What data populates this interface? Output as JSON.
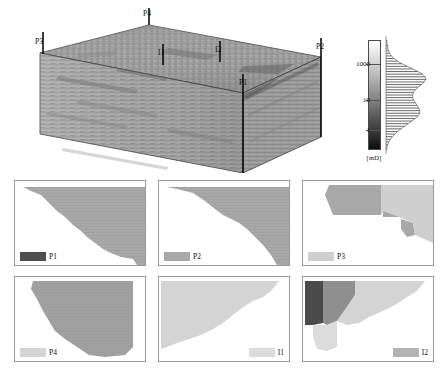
{
  "figure": {
    "header_remnant": "",
    "type": "reservoir-permeability-model"
  },
  "block": {
    "title": "3D reservoir permeability block",
    "wells": [
      {
        "name": "P4",
        "label": "P4",
        "x": 128,
        "y": 10,
        "stem_x": 131,
        "stem_top": 17,
        "stem_bottom": 45,
        "kind": "producer"
      },
      {
        "name": "P3",
        "label": "P3",
        "x": 22,
        "y": 36,
        "stem_x": 25,
        "stem_top": 43,
        "stem_bottom": 67,
        "kind": "producer"
      },
      {
        "name": "I1",
        "label": "I1",
        "x": 142,
        "y": 48,
        "stem_x": 145,
        "stem_top": 55,
        "stem_bottom": 77,
        "kind": "injector"
      },
      {
        "name": "I2",
        "label": "I2",
        "x": 199,
        "y": 45,
        "stem_x": 202,
        "stem_top": 52,
        "stem_bottom": 74,
        "kind": "injector"
      },
      {
        "name": "P2",
        "label": "P2",
        "x": 300,
        "y": 42,
        "stem_x": 303,
        "stem_top": 49,
        "stem_bottom": 140,
        "kind": "producer"
      },
      {
        "name": "P1",
        "label": "P1",
        "x": 222,
        "y": 78,
        "stem_x": 225,
        "stem_top": 85,
        "stem_bottom": 165,
        "kind": "producer"
      }
    ]
  },
  "colorbar": {
    "name": "permeability-colorbar",
    "unit": "[mD]",
    "scale": "log",
    "ticks": [
      {
        "label": "1000",
        "value": 1000,
        "pos_pct": 22
      },
      {
        "label": "10",
        "value": 10,
        "pos_pct": 55
      },
      {
        "label": "1",
        "value": 1,
        "pos_pct": 83
      }
    ],
    "min_color": "#ffffff",
    "max_color": "#0d0d0d",
    "histogram": {
      "name": "permeability-histogram",
      "orientation": "horizontal-bars",
      "bins": [
        1,
        1,
        2,
        2,
        3,
        4,
        6,
        9,
        13,
        18,
        24,
        30,
        36,
        41,
        44,
        45,
        43,
        40,
        36,
        33,
        31,
        30,
        30,
        31,
        33,
        35,
        37,
        38,
        38,
        36,
        33,
        29,
        25,
        21,
        17,
        13,
        10,
        7,
        5,
        3,
        2,
        1,
        1
      ]
    }
  },
  "chart_data": {
    "type": "heatmap",
    "xlabel": "",
    "ylabel": "",
    "colorbar_unit": "[mD]",
    "colorbar_ticks": [
      1,
      10,
      1000
    ],
    "colorbar_scale": "log",
    "grid": false,
    "legend_position": "in-panel",
    "series": [
      {
        "name": "P4",
        "values": [
          1000,
          500,
          100,
          10,
          1
        ]
      },
      {
        "name": "P3",
        "values": [
          1000,
          500,
          100,
          10,
          1
        ]
      },
      {
        "name": "P2",
        "values": [
          1000,
          500,
          100,
          10,
          1
        ]
      },
      {
        "name": "P1",
        "values": [
          1000,
          500,
          100,
          10,
          1
        ]
      },
      {
        "name": "I1",
        "values": [
          1000,
          500,
          100,
          10,
          1
        ]
      },
      {
        "name": "I2",
        "values": [
          1000,
          500,
          100,
          10,
          1
        ]
      }
    ],
    "panels": [
      {
        "id": "P1",
        "label": "P1",
        "row": 0,
        "col": 0,
        "swatch_color": "#4f4f4f",
        "legend_side": "left",
        "description": "Staircase drainage region descending from upper-left to lower-right; region fills upper-right of panel.",
        "regions": [
          {
            "color": "#a8a8a8",
            "poly": "8,6 130,6 130,84 122,84 118,78 106,76 96,72 88,68 80,62 72,56 66,50 58,44 50,36 42,30 34,22 26,14 16,10"
          }
        ],
        "stripes": true
      },
      {
        "id": "P2",
        "label": "P2",
        "row": 0,
        "col": 1,
        "swatch_color": "#a8a8a8",
        "legend_side": "left",
        "description": "Drainage region with a broad plateau mid-panel then a steep drop on the right.",
        "regions": [
          {
            "color": "#a8a8a8",
            "poly": "8,6 130,6 130,84 118,84 112,74 104,64 96,56 88,48 80,42 72,38 64,34 56,28 46,20 34,12 18,8"
          }
        ],
        "stripes": true
      },
      {
        "id": "P3",
        "label": "P3",
        "row": 0,
        "col": 2,
        "swatch_color": "#cfcfcf",
        "legend_side": "left",
        "description": "Compact blob in upper-left plus small detached fragments trailing toward lower-right.",
        "regions": [
          {
            "color": "#a8a8a8",
            "poly": "26,4 78,4 78,34 30,34 26,24 22,14"
          },
          {
            "color": "#a8a8a8",
            "poly": "80,30 96,30 96,36 80,36"
          },
          {
            "color": "#a8a8a8",
            "poly": "98,38 110,42 112,54 104,56 98,48"
          },
          {
            "color": "#cfcfcf",
            "poly": "78,4 130,4 130,62 112,54 110,42 96,36 80,30 78,34"
          }
        ],
        "stripes": false
      },
      {
        "id": "P4",
        "label": "P4",
        "row": 1,
        "col": 0,
        "swatch_color": "#d4d4d4",
        "legend_side": "left",
        "description": "Large striped drainage region occupying most of the panel, stepping down to the lower-right.",
        "regions": [
          {
            "color": "#a0a0a0",
            "poly": "18,4 118,4 118,70 110,78 90,80 74,78 62,70 50,62 40,54 34,44 28,34 22,22 16,12"
          }
        ],
        "stripes": true
      },
      {
        "id": "I1",
        "label": "I1",
        "row": 1,
        "col": 1,
        "swatch_color": "#dcdcdc",
        "legend_side": "right",
        "description": "Light sweep region covering the upper-left, boundary rising toward the right.",
        "regions": [
          {
            "color": "#d4d4d4",
            "poly": "2,4 120,4 112,14 104,20 94,24 84,30 74,38 64,46 54,52 42,58 30,62 18,66 8,70 2,72"
          }
        ],
        "stripes": false
      },
      {
        "id": "I2",
        "label": "I2",
        "row": 1,
        "col": 2,
        "swatch_color": "#b4b4b4",
        "legend_side": "right",
        "description": "Layered multi-tone sweep: dark band at far left, medium band next, light band sweeping right.",
        "regions": [
          {
            "color": "#4a4a4a",
            "poly": "2,4 20,4 20,46 10,48 2,48"
          },
          {
            "color": "#8f8f8f",
            "poly": "20,4 52,4 52,18 44,30 34,44 24,48 20,46"
          },
          {
            "color": "#d4d4d4",
            "poly": "52,4 122,4 114,14 104,20 92,28 80,34 66,40 56,46 44,48 34,44 44,30 52,18"
          },
          {
            "color": "#dcdcdc",
            "poly": "10,48 24,48 34,44 34,70 24,74 14,72 10,60"
          }
        ],
        "stripes": false
      }
    ]
  }
}
